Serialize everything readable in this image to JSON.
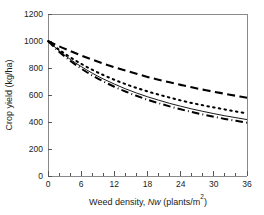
{
  "chart_data": {
    "type": "line",
    "title": "",
    "xlabel": "Weed density, Nw (plants/m2)",
    "xlabel_parts": {
      "prefix": "Weed density, ",
      "italic": "Nw",
      "suffix_open": " (plants/m",
      "superscript": "2",
      "suffix_close": ")"
    },
    "ylabel": "Crop yield (kg/ha)",
    "xlim": [
      0,
      36
    ],
    "ylim": [
      0,
      1200
    ],
    "xticks": [
      0,
      6,
      12,
      18,
      24,
      30,
      36
    ],
    "xtick_labels": [
      "0",
      "6",
      "12",
      "18",
      "24",
      "30",
      "36"
    ],
    "x_minor_tick_step": 2,
    "yticks": [
      0,
      200,
      400,
      600,
      800,
      1000,
      1200
    ],
    "ytick_labels": [
      "0",
      "200",
      "400",
      "600",
      "800",
      "1000",
      "1200"
    ],
    "grid": false,
    "legend": "none",
    "curve_color": "#000000",
    "frame_color": "#8a8a8a",
    "x": [
      0,
      2,
      4,
      6,
      8,
      10,
      12,
      14,
      16,
      18,
      20,
      22,
      24,
      26,
      28,
      30,
      32,
      34,
      36
    ],
    "series": [
      {
        "name": "curve-dashed",
        "style": "dashed",
        "values": [
          1000,
          961,
          926,
          893,
          862,
          833,
          806,
          781,
          757,
          734,
          713,
          694,
          675,
          657,
          640,
          624,
          609,
          594,
          580
        ]
      },
      {
        "name": "curve-dotted",
        "style": "dotted",
        "values": [
          1000,
          936,
          880,
          831,
          787,
          748,
          713,
          681,
          653,
          627,
          603,
          581,
          560,
          541,
          524,
          508,
          493,
          478,
          465
        ]
      },
      {
        "name": "curve-solid",
        "style": "solid",
        "values": [
          1000,
          928,
          865,
          811,
          762,
          719,
          681,
          646,
          615,
          587,
          562,
          538,
          517,
          497,
          479,
          462,
          446,
          432,
          418
        ]
      },
      {
        "name": "curve-dashdot",
        "style": "dash-dot",
        "values": [
          1000,
          921,
          854,
          796,
          745,
          701,
          661,
          626,
          594,
          565,
          540,
          516,
          494,
          474,
          456,
          439,
          423,
          409,
          395
        ]
      }
    ]
  },
  "geometry": {
    "plot_left": 48,
    "plot_right": 247,
    "plot_top": 14,
    "plot_bottom": 176
  }
}
